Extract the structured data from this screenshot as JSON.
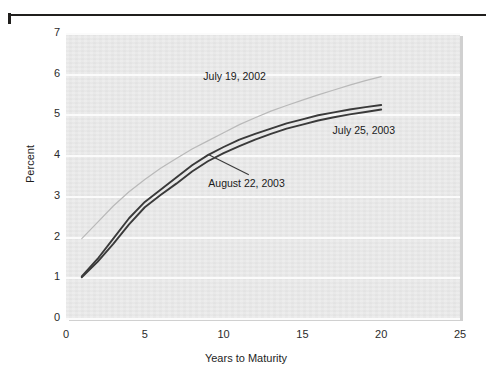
{
  "chart_data": {
    "type": "line",
    "title": "",
    "xlabel": "Years to Maturity",
    "ylabel": "Percent",
    "xlim": [
      0,
      25
    ],
    "ylim": [
      0,
      7
    ],
    "xticks": [
      "0",
      "5",
      "10",
      "15",
      "20",
      "25"
    ],
    "yticks": [
      "0",
      "1",
      "2",
      "3",
      "4",
      "5",
      "6",
      "7"
    ],
    "grid": "horizontal",
    "legend_position": "inline-annotations",
    "series": [
      {
        "name": "July 19, 2002",
        "color": "#b9b9b9",
        "x": [
          1,
          2,
          3,
          4,
          5,
          6,
          7,
          8,
          9,
          10,
          11,
          12,
          13,
          14,
          15,
          16,
          17,
          18,
          19,
          20
        ],
        "values": [
          1.95,
          2.35,
          2.75,
          3.1,
          3.4,
          3.68,
          3.92,
          4.15,
          4.35,
          4.55,
          4.75,
          4.92,
          5.08,
          5.22,
          5.35,
          5.48,
          5.6,
          5.72,
          5.83,
          5.93
        ]
      },
      {
        "name": "July 25, 2003",
        "color": "#3a3a3a",
        "x": [
          1,
          2,
          3,
          4,
          5,
          6,
          7,
          8,
          9,
          10,
          11,
          12,
          13,
          14,
          15,
          16,
          17,
          18,
          19,
          20
        ],
        "values": [
          1.02,
          1.45,
          1.95,
          2.45,
          2.85,
          3.15,
          3.45,
          3.75,
          4.0,
          4.2,
          4.38,
          4.52,
          4.65,
          4.78,
          4.88,
          4.98,
          5.05,
          5.12,
          5.18,
          5.23
        ]
      },
      {
        "name": "August 22, 2003",
        "color": "#3a3a3a",
        "x": [
          1,
          2,
          3,
          4,
          5,
          6,
          7,
          8,
          9,
          10,
          11,
          12,
          13,
          14,
          15,
          16,
          17,
          18,
          19,
          20
        ],
        "values": [
          1.0,
          1.38,
          1.82,
          2.3,
          2.72,
          3.02,
          3.3,
          3.6,
          3.85,
          4.05,
          4.22,
          4.38,
          4.52,
          4.65,
          4.75,
          4.85,
          4.93,
          5.0,
          5.06,
          5.12
        ]
      }
    ],
    "annotations": [
      {
        "text": "July 19, 2002",
        "x": 11.0,
        "y": 5.95
      },
      {
        "text": "July 25, 2003",
        "x": 19.2,
        "y": 4.62
      },
      {
        "text": "August 22, 2003",
        "x": 10.3,
        "y": 3.32
      }
    ]
  },
  "axes": {
    "y_title": "Percent",
    "x_title": "Years to Maturity",
    "y_tick_labels": [
      "7",
      "6",
      "5",
      "4",
      "3",
      "2",
      "1",
      "0"
    ],
    "x_tick_labels": [
      "0",
      "5",
      "10",
      "15",
      "20",
      "25"
    ]
  },
  "labels": {
    "series_2002": "July 19, 2002",
    "series_2003_july": "July 25, 2003",
    "series_2003_august": "August 22, 2003"
  }
}
